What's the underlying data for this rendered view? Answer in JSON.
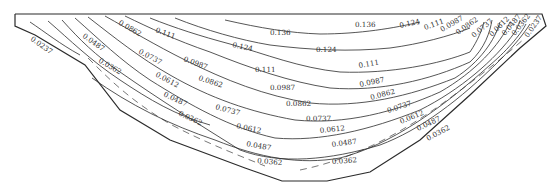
{
  "figure": {
    "type": "contour-diagram",
    "stroke_color": "#2b2b2b",
    "background": "#ffffff"
  },
  "contour_levels": [
    "0.0237",
    "0.0362",
    "0.0487",
    "0.0612",
    "0.0737",
    "0.0862",
    "0.0987",
    "0.111",
    "0.124",
    "0.136"
  ],
  "labels": {
    "l0": "0.0237",
    "l1": "0.0487",
    "l2": "0.0362",
    "l3": "0.0862",
    "l4": "0.0737",
    "l5": "0.0612",
    "l6": "0.0487",
    "l7": "0.0362",
    "l8": "0.111",
    "l9": "0.0987",
    "l10": "0.0862",
    "l11": "0.0737",
    "l12": "0.0612",
    "l13": "0.0487",
    "l14": "0.0362",
    "l15": "0.136",
    "l16": "0.124",
    "l17": "0.111",
    "l18": "0.0987",
    "l19": "0.0862",
    "l20": "0.0737",
    "l21": "0.0612",
    "l22": "0.0487",
    "l23": "0.0362",
    "l24": "0.124",
    "l25": "0.136",
    "l26": "0.124",
    "l27": "0.111",
    "l28": "0.0987",
    "l29": "0.0862",
    "l30": "0.0737",
    "l31": "0.0612",
    "l32": "0.0487",
    "l33": "0.0362",
    "l34": "0.111",
    "l35": "0.0987",
    "l36": "0.0862",
    "l37": "0.0737",
    "l38": "0.0612",
    "l39": "0.0487",
    "l40": "0.0362",
    "l41": "0.0237"
  }
}
